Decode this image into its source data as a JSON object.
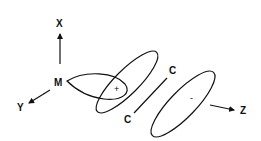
{
  "diagram": {
    "type": "orbital-lobe-diagram",
    "axes": {
      "x_label": "X",
      "y_label": "Y",
      "z_label": "Z"
    },
    "origin_label": "M",
    "bond_labels": [
      "C",
      "C"
    ],
    "lobe_signs": {
      "positive": "+",
      "negative": "-"
    },
    "colors": {
      "ink": "#111111",
      "background": "#ffffff"
    }
  }
}
